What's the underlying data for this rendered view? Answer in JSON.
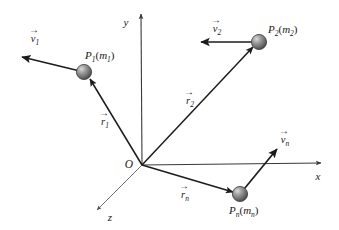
{
  "figure": {
    "background_color": "#ffffff",
    "axes": {
      "origin_label": "O",
      "x_label": "x",
      "y_label": "y",
      "z_label": "z",
      "axis_color": "#3a3a3a",
      "z_axis_color": "#6e6e6e"
    },
    "particles": [
      {
        "id": "p1",
        "label_base": "P",
        "label_sub": "1",
        "mass_base": "m",
        "mass_sub": "1",
        "label_full": "P1(m1)",
        "position_vector": {
          "base": "r",
          "sub": "1",
          "label_full": "r1"
        },
        "velocity_vector": {
          "base": "v",
          "sub": "1",
          "label_full": "v1"
        },
        "sphere_color": "#8c8c8c"
      },
      {
        "id": "p2",
        "label_base": "P",
        "label_sub": "2",
        "mass_base": "m",
        "mass_sub": "2",
        "label_full": "P2(m2)",
        "position_vector": {
          "base": "r",
          "sub": "2",
          "label_full": "r2"
        },
        "velocity_vector": {
          "base": "v",
          "sub": "2",
          "label_full": "v2"
        },
        "sphere_color": "#8c8c8c"
      },
      {
        "id": "pn",
        "label_base": "P",
        "label_sub": "n",
        "mass_base": "m",
        "mass_sub": "n",
        "label_full": "Pn(mn)",
        "position_vector": {
          "base": "r",
          "sub": "n",
          "label_full": "rn"
        },
        "velocity_vector": {
          "base": "v",
          "sub": "n",
          "label_full": "vn"
        },
        "sphere_color": "#8c8c8c"
      }
    ],
    "vector_accent": "→",
    "paren_open": "(",
    "paren_close": ")"
  }
}
